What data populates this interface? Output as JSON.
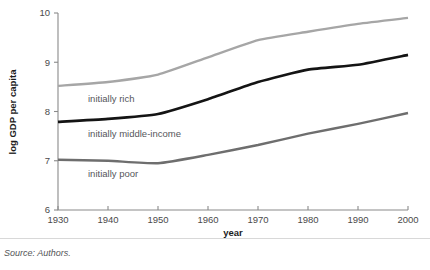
{
  "figure": {
    "source_note": "Source: Authors."
  },
  "chart_data": {
    "type": "line",
    "title": "",
    "xlabel": "year",
    "ylabel": "log GDP per capita",
    "x": [
      1930,
      1940,
      1950,
      1960,
      1970,
      1980,
      1990,
      2000
    ],
    "xticks": [
      "1930",
      "1940",
      "1950",
      "1960",
      "1970",
      "1980",
      "1990",
      "2000"
    ],
    "yticks": [
      "6",
      "7",
      "8",
      "9",
      "10"
    ],
    "xlim": [
      1930,
      2000
    ],
    "ylim": [
      6,
      10
    ],
    "grid": false,
    "legend_position": "inline-labels",
    "series": [
      {
        "name": "initially rich",
        "color": "#a6a6a6",
        "label": "initially rich",
        "label_x": 1936,
        "label_y": 8.27,
        "values": [
          8.52,
          8.6,
          8.75,
          9.1,
          9.45,
          9.62,
          9.78,
          9.9
        ]
      },
      {
        "name": "initially middle-income",
        "color": "#141414",
        "label": "initially middle-income",
        "label_x": 1936,
        "label_y": 7.55,
        "values": [
          7.79,
          7.85,
          7.95,
          8.25,
          8.6,
          8.85,
          8.95,
          9.15
        ]
      },
      {
        "name": "initially poor",
        "color": "#6e6e6e",
        "label": "initially poor",
        "label_x": 1936,
        "label_y": 6.73,
        "values": [
          7.02,
          7.0,
          6.95,
          7.12,
          7.32,
          7.55,
          7.75,
          7.97
        ]
      }
    ]
  }
}
